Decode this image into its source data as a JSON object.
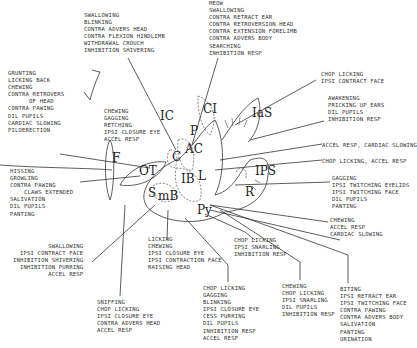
{
  "diagram": {
    "regions": [
      {
        "id": "IC",
        "label": "IC",
        "x": 160,
        "y": 117
      },
      {
        "id": "OT",
        "label": "OT",
        "x": 139,
        "y": 172
      },
      {
        "id": "F",
        "label": "F",
        "x": 112,
        "y": 159
      },
      {
        "id": "C",
        "label": "C",
        "x": 172,
        "y": 158
      },
      {
        "id": "AC",
        "label": "AC",
        "x": 185,
        "y": 150
      },
      {
        "id": "CI",
        "label": "CI",
        "x": 203,
        "y": 110
      },
      {
        "id": "P",
        "label": "P",
        "x": 190,
        "y": 132
      },
      {
        "id": "IB",
        "label": "IB",
        "x": 181,
        "y": 180
      },
      {
        "id": "L",
        "label": "L",
        "x": 198,
        "y": 177
      },
      {
        "id": "mB",
        "label": "mB",
        "x": 158,
        "y": 197
      },
      {
        "id": "S",
        "label": "S",
        "x": 148,
        "y": 194
      },
      {
        "id": "Py",
        "label": "Py",
        "x": 197,
        "y": 211
      },
      {
        "id": "IaS",
        "label": "IaS",
        "x": 252,
        "y": 114
      },
      {
        "id": "IPS",
        "label": "IPS",
        "x": 255,
        "y": 172
      },
      {
        "id": "R",
        "label": "R",
        "x": 245,
        "y": 193
      }
    ],
    "annotations": [
      {
        "id": "top-center-left",
        "x": 84,
        "y": 12,
        "align": "left",
        "lines": [
          "SWALLOWING",
          "BLINKING",
          "CONTRA ADVERS HEAD",
          "CONTRA FLEXION HINDLIMB",
          "WITHDRAWAL CROUCH",
          "INHIBITION SHIVERING"
        ]
      },
      {
        "id": "top-center-right",
        "x": 209,
        "y": 0,
        "align": "left",
        "lines": [
          "MEOW",
          "SWALLOWING",
          "CONTRA RETRACT EAR",
          "CONTRA RETROVERSION HEAD",
          "CONTRA EXTENSION FORELIMB",
          "CONTRA ADVERS BODY",
          "SEARCHING",
          "INHIBITION RESP"
        ]
      },
      {
        "id": "left-upper",
        "x": 8,
        "y": 70,
        "align": "left",
        "lines": [
          "GRUNTING",
          "LICKING BACK",
          "CHEWING",
          "CONTRA RETROVERS",
          "      OF HEAD",
          "CONTRA PAWING",
          "DIL PUPILS",
          "CARDIAC SLOWING",
          "PILOERECTION"
        ]
      },
      {
        "id": "center-chewing",
        "x": 104,
        "y": 108,
        "align": "left",
        "lines": [
          "CHEWING",
          "GAGGING",
          "RETCHING",
          "IPSI CLOSURE EYE",
          "ACCEL RESP"
        ]
      },
      {
        "id": "right-chop-face",
        "x": 321,
        "y": 71,
        "align": "left",
        "lines": [
          "CHOP LICKING",
          "IPSI CONTRACT FACE"
        ]
      },
      {
        "id": "right-awakening",
        "x": 328,
        "y": 95,
        "align": "left",
        "lines": [
          "AWAKENING",
          "PRICKING UP EARS",
          "DIL PUPILS",
          "INHIBITION RESP"
        ]
      },
      {
        "id": "right-accel-cardiac",
        "x": 322,
        "y": 142,
        "align": "left",
        "lines": [
          "ACCEL RESP, CARDIAC SLOWING"
        ]
      },
      {
        "id": "right-chop-accel",
        "x": 322,
        "y": 158,
        "align": "left",
        "lines": [
          "CHOP LICKING, ACCEL RESP"
        ]
      },
      {
        "id": "right-gagging",
        "x": 332,
        "y": 175,
        "align": "left",
        "lines": [
          "GAGGING",
          "IPSI TWITCHING EYELIDS",
          "IPSI TWITCHING FACE",
          "DIL PUPILS",
          "PANTING"
        ]
      },
      {
        "id": "right-chewing",
        "x": 330,
        "y": 217,
        "align": "left",
        "lines": [
          "CHEWING",
          "ACCEL RESP",
          "CARDIAC SLOWING"
        ]
      },
      {
        "id": "left-hissing",
        "x": 10,
        "y": 168,
        "align": "left",
        "lines": [
          "HISSING",
          "GROWLING",
          "CONTRA PAWING",
          "    CLAWS EXTENDED",
          "SALIVATION",
          "DIL PUPILS",
          "PANTING"
        ]
      },
      {
        "id": "left-swallowing",
        "x": 13,
        "y": 243,
        "align": "right",
        "lines": [
          "SWALLOWING",
          "IPSI CONTRACT FACE",
          "INHIBITION SHIVERING",
          "INHIBITION PURRING",
          "ACCEL RESP"
        ]
      },
      {
        "id": "bottom-licking",
        "x": 148,
        "y": 236,
        "align": "left",
        "lines": [
          "LICKING",
          "CHEWING",
          "IPSI CLOSURE EYE",
          "IPSI CONTRACTION FACE",
          "RAISING HEAD"
        ]
      },
      {
        "id": "bottom-chop-snarling",
        "x": 234,
        "y": 237,
        "align": "left",
        "lines": [
          "CHOP LICKING",
          "IPSI SNARLING",
          "INHIBITION RESP"
        ]
      },
      {
        "id": "bottom-sniffing",
        "x": 97,
        "y": 299,
        "align": "left",
        "lines": [
          "SNIFFING",
          "CHOP LICKING",
          "IPSI CLOSURE EYE",
          "CONTRA ADVERS HEAD",
          "ACCEL RESP"
        ]
      },
      {
        "id": "bottom-chop-gagging",
        "x": 203,
        "y": 285,
        "align": "left",
        "lines": [
          "CHOP LICKING",
          "GAGGING",
          "BLINKING",
          "IPSI CLOSURE EYE",
          "CESS PURRING",
          "DIL PUPILS",
          "INHIBITION RESP",
          "ACCEL RESP"
        ]
      },
      {
        "id": "bottom-chewing-snarling",
        "x": 282,
        "y": 283,
        "align": "left",
        "lines": [
          "CHEWING",
          "CHOP LICKING",
          "IPSI SNARLING",
          "DIL PUPILS",
          "INHIBITION RESP"
        ]
      },
      {
        "id": "bottom-biting",
        "x": 340,
        "y": 286,
        "align": "left",
        "lines": [
          "BITING",
          "IPSI RETRACT EAR",
          "IPSI TWITCHING FACE",
          "CONTRA PAWING",
          "CONTRA ADVERS BODY",
          "SALIVATION",
          "PANTING",
          "URINATION"
        ]
      }
    ]
  }
}
